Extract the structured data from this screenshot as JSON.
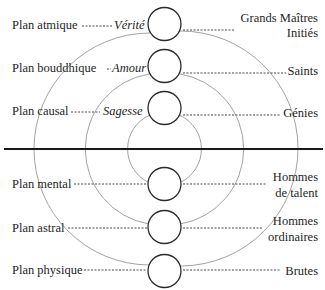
{
  "diagram": {
    "colors": {
      "circle_stroke": "#2a2a2a",
      "arc_stroke": "#8a8a8a",
      "divider": "#1a1a1a",
      "dash": "#333333",
      "text": "#1e1e1e"
    },
    "upper": {
      "planes": [
        "Plan atmique",
        "Plan bouddhique",
        "Plan causal"
      ],
      "qualities": [
        "Vérité",
        "Amour",
        "Sagesse"
      ],
      "beings": [
        {
          "line1": "Grands Maîtres",
          "line2": "Initiés"
        },
        {
          "line1": "Saints"
        },
        {
          "line1": "Génies"
        }
      ]
    },
    "lower": {
      "planes": [
        "Plan mental",
        "Plan astral",
        "Plan physique"
      ],
      "beings": [
        {
          "line1": "Hommes",
          "line2": "de talent"
        },
        {
          "line1": "Hommes",
          "line2": "ordinaires"
        },
        {
          "line1": "Brutes"
        }
      ]
    }
  }
}
